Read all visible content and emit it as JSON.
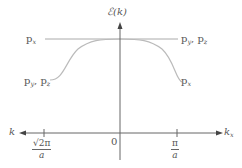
{
  "diagram": {
    "y_axis_label": "ℰ(k)",
    "x_axis_right_label": "k",
    "x_axis_right_sub": "x",
    "x_axis_left_label": "k",
    "origin_label": "0",
    "tick_left": {
      "numerator": "√2π",
      "denominator": "a"
    },
    "tick_right": {
      "numerator": "π",
      "denominator": "a"
    },
    "flat_band": {
      "left_label": {
        "base": "p",
        "sub": "x"
      },
      "right_label_1": {
        "base": "p",
        "sub": "y"
      },
      "right_label_2": {
        "base": "p",
        "sub": "z"
      }
    },
    "curved_band": {
      "left_label_1": {
        "base": "p",
        "sub": "y"
      },
      "left_label_2": {
        "base": "p",
        "sub": "z"
      },
      "right_label": {
        "base": "p",
        "sub": "x"
      }
    },
    "colors": {
      "axis": "#666666",
      "curve": "#b8b8b8",
      "text": "#555555"
    }
  }
}
